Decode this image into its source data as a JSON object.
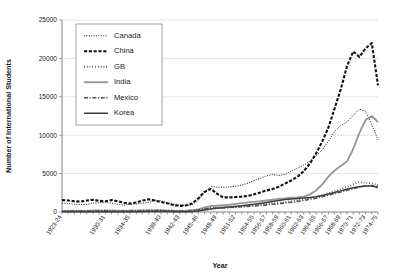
{
  "chart_data": {
    "type": "line",
    "title": "",
    "xlabel": "Year",
    "ylabel": "Number of International Students",
    "ylim": [
      0,
      25000
    ],
    "ytick_values": [
      0,
      5000,
      10000,
      15000,
      20000,
      25000
    ],
    "ytick_labels": [
      "0",
      "5000",
      "10000",
      "15000",
      "20000",
      "25000"
    ],
    "grid": true,
    "legend_position": "top-left",
    "x": [
      "1923-24",
      "1924-25",
      "1925-26",
      "1926-27",
      "1927-28",
      "1928-29",
      "1929-30",
      "1930-31",
      "1931-32",
      "1932-33",
      "1933-34",
      "1934-35",
      "1935-36",
      "1936-37",
      "1937-38",
      "1938-39",
      "1939-40",
      "1940-41",
      "1941-42",
      "1942-43",
      "1943-44",
      "1944-45",
      "1945-46",
      "1946-47",
      "1947-48",
      "1948-49",
      "1949-50",
      "1950-51",
      "1951-52",
      "1952-53",
      "1953-54",
      "1954-55",
      "1955-56",
      "1956-57",
      "1957-58",
      "1958-59",
      "1959-60",
      "1960-61",
      "1961-62",
      "1962-63",
      "1963-64",
      "1964-65",
      "1965-66",
      "1966-67",
      "1967-68",
      "1968-69",
      "1969-70",
      "1970-71",
      "1971-72",
      "1972-73",
      "1973-74",
      "1974-75"
    ],
    "xtick_labels": [
      "1923-24",
      "1930-31",
      "1934-35",
      "1939-40",
      "1942-43",
      "1945-46",
      "1948-49",
      "1951-52",
      "1954-55",
      "1956-57",
      "1958-59",
      "1960-61",
      "1962-63",
      "1964-65",
      "1966-67",
      "1968-69",
      "1970-71",
      "1972-73",
      "1974-75"
    ],
    "xtick_indices": [
      0,
      7,
      11,
      16,
      19,
      22,
      25,
      28,
      31,
      33,
      35,
      37,
      39,
      41,
      43,
      45,
      47,
      49,
      51
    ],
    "series": [
      {
        "name": "Canada",
        "style": "fine-dotted",
        "color": "#1a1a1a",
        "width": 1.0,
        "dash": "1,1.4",
        "values": [
          1150,
          1100,
          1000,
          950,
          1000,
          1150,
          1200,
          1250,
          1150,
          1000,
          900,
          1000,
          1050,
          1150,
          1250,
          1500,
          1450,
          1200,
          1000,
          900,
          850,
          950,
          1500,
          2600,
          3300,
          3250,
          3200,
          3250,
          3350,
          3500,
          3750,
          4100,
          4400,
          4700,
          4900,
          4750,
          4900,
          5300,
          5700,
          6100,
          6600,
          7300,
          8100,
          9200,
          10500,
          11300,
          11700,
          12600,
          13400,
          13100,
          11400,
          9400
        ]
      },
      {
        "name": "China",
        "style": "thick-dashed",
        "color": "#111111",
        "width": 2.1,
        "dash": "3.2,1.6",
        "values": [
          1550,
          1500,
          1400,
          1350,
          1500,
          1600,
          1450,
          1400,
          1550,
          1400,
          1200,
          1100,
          1250,
          1500,
          1650,
          1500,
          1300,
          1150,
          900,
          800,
          850,
          1100,
          1800,
          2600,
          3000,
          2400,
          1900,
          1900,
          1950,
          2000,
          2100,
          2300,
          2550,
          2800,
          3000,
          3300,
          3700,
          4100,
          4600,
          5300,
          6300,
          7600,
          9200,
          11000,
          13500,
          16000,
          19000,
          20900,
          20200,
          21300,
          22000,
          16500
        ]
      },
      {
        "name": "GB",
        "style": "round-dotted",
        "color": "#111111",
        "width": 1.9,
        "dash": "0.6,2.2",
        "values": [
          150,
          160,
          170,
          170,
          180,
          190,
          200,
          200,
          190,
          180,
          180,
          190,
          200,
          220,
          230,
          240,
          230,
          210,
          180,
          170,
          180,
          220,
          320,
          450,
          520,
          560,
          580,
          620,
          680,
          740,
          800,
          860,
          940,
          1020,
          1100,
          1180,
          1280,
          1400,
          1520,
          1650,
          1800,
          1980,
          2200,
          2450,
          2700,
          2950,
          3250,
          3600,
          3900,
          3800,
          3750,
          3500
        ]
      },
      {
        "name": "India",
        "style": "solid-gray",
        "color": "#999999",
        "width": 1.9,
        "dash": "",
        "values": [
          120,
          130,
          130,
          140,
          150,
          160,
          170,
          180,
          170,
          160,
          150,
          160,
          170,
          190,
          200,
          210,
          200,
          180,
          150,
          140,
          150,
          200,
          350,
          600,
          750,
          820,
          880,
          950,
          1050,
          1150,
          1250,
          1320,
          1400,
          1500,
          1600,
          1700,
          1780,
          1850,
          1900,
          2000,
          2300,
          2800,
          3600,
          4600,
          5400,
          6000,
          6600,
          8200,
          10300,
          12000,
          12500,
          11700
        ]
      },
      {
        "name": "Mexico",
        "style": "dash-dot",
        "color": "#555555",
        "width": 1.6,
        "dash": "4,1.6,1.2,1.6",
        "values": [
          100,
          110,
          110,
          120,
          130,
          140,
          150,
          150,
          140,
          130,
          130,
          140,
          150,
          160,
          170,
          180,
          175,
          160,
          140,
          130,
          140,
          180,
          280,
          400,
          470,
          510,
          540,
          580,
          630,
          680,
          730,
          790,
          860,
          930,
          1000,
          1080,
          1170,
          1270,
          1380,
          1500,
          1640,
          1800,
          1990,
          2200,
          2400,
          2600,
          2820,
          3050,
          3250,
          3400,
          3450,
          3300
        ]
      },
      {
        "name": "Korea",
        "style": "solid-dark",
        "color": "#3d3d3d",
        "width": 1.5,
        "dash": "",
        "values": [
          20,
          20,
          25,
          25,
          30,
          30,
          35,
          35,
          35,
          30,
          30,
          35,
          40,
          45,
          50,
          55,
          55,
          50,
          45,
          40,
          45,
          60,
          120,
          260,
          400,
          500,
          580,
          650,
          720,
          800,
          900,
          1000,
          1120,
          1250,
          1380,
          1500,
          1620,
          1700,
          1760,
          1820,
          1900,
          2000,
          2150,
          2350,
          2550,
          2750,
          2950,
          3150,
          3300,
          3400,
          3380,
          3200
        ]
      }
    ]
  }
}
